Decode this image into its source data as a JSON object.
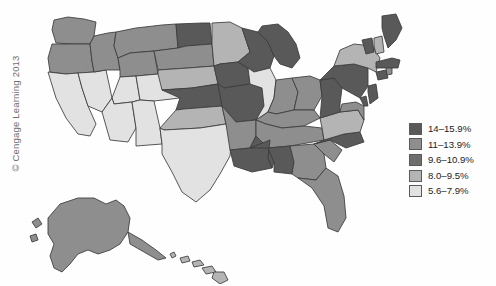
{
  "figure": {
    "credit": "© Cengage Learning 2013",
    "background_color": "#ffffff",
    "border_color": "#3b3b3b",
    "water_color": "#ffffff"
  },
  "legend": {
    "name": "choropleth-legend",
    "position": "right",
    "items": [
      {
        "label": "14–15.9%",
        "color": "#595959",
        "min": 14.0,
        "max": 15.9
      },
      {
        "label": "11–13.9%",
        "color": "#8e8e8e",
        "min": 11.0,
        "max": 13.9
      },
      {
        "label": "9.6–10.9%",
        "color": "#6e6e6e",
        "min": 9.6,
        "max": 10.9
      },
      {
        "label": "8.0–9.5%",
        "color": "#b4b4b4",
        "min": 8.0,
        "max": 9.5
      },
      {
        "label": "5.6–7.9%",
        "color": "#e2e2e2",
        "min": 5.6,
        "max": 7.9
      }
    ]
  },
  "chart_data": {
    "type": "choropleth",
    "title": "",
    "xlabel": "",
    "ylabel": "",
    "unit": "%",
    "value_bins": [
      "5.6–7.9%",
      "8.0–9.5%",
      "9.6–10.9%",
      "11–13.9%",
      "14–15.9%"
    ],
    "bin_colors": [
      "#e2e2e2",
      "#b4b4b4",
      "#6e6e6e",
      "#8e8e8e",
      "#595959"
    ],
    "regions": [
      {
        "code": "WA",
        "name": "Washington",
        "bin": "11–13.9%",
        "color": "#8e8e8e"
      },
      {
        "code": "OR",
        "name": "Oregon",
        "bin": "11–13.9%",
        "color": "#8e8e8e"
      },
      {
        "code": "ID",
        "name": "Idaho",
        "bin": "11–13.9%",
        "color": "#8e8e8e"
      },
      {
        "code": "MT",
        "name": "Montana",
        "bin": "11–13.9%",
        "color": "#8e8e8e"
      },
      {
        "code": "WY",
        "name": "Wyoming",
        "bin": "11–13.9%",
        "color": "#8e8e8e"
      },
      {
        "code": "ND",
        "name": "North Dakota",
        "bin": "14–15.9%",
        "color": "#595959"
      },
      {
        "code": "SD",
        "name": "South Dakota",
        "bin": "11–13.9%",
        "color": "#8e8e8e"
      },
      {
        "code": "NE",
        "name": "Nebraska",
        "bin": "8.0–9.5%",
        "color": "#b4b4b4"
      },
      {
        "code": "MN",
        "name": "Minnesota",
        "bin": "8.0–9.5%",
        "color": "#b4b4b4"
      },
      {
        "code": "IA",
        "name": "Iowa",
        "bin": "14–15.9%",
        "color": "#595959"
      },
      {
        "code": "WI",
        "name": "Wisconsin",
        "bin": "14–15.9%",
        "color": "#595959"
      },
      {
        "code": "MI",
        "name": "Michigan",
        "bin": "14–15.9%",
        "color": "#595959"
      },
      {
        "code": "IL",
        "name": "Illinois",
        "bin": "5.6–7.9%",
        "color": "#e2e2e2"
      },
      {
        "code": "IN",
        "name": "Indiana",
        "bin": "11–13.9%",
        "color": "#8e8e8e"
      },
      {
        "code": "OH",
        "name": "Ohio",
        "bin": "11–13.9%",
        "color": "#8e8e8e"
      },
      {
        "code": "MO",
        "name": "Missouri",
        "bin": "14–15.9%",
        "color": "#595959"
      },
      {
        "code": "KS",
        "name": "Kansas",
        "bin": "14–15.9%",
        "color": "#595959"
      },
      {
        "code": "OK",
        "name": "Oklahoma",
        "bin": "8.0–9.5%",
        "color": "#b4b4b4"
      },
      {
        "code": "TX",
        "name": "Texas",
        "bin": "5.6–7.9%",
        "color": "#e2e2e2"
      },
      {
        "code": "NM",
        "name": "New Mexico",
        "bin": "5.6–7.9%",
        "color": "#e2e2e2"
      },
      {
        "code": "AZ",
        "name": "Arizona",
        "bin": "5.6–7.9%",
        "color": "#e2e2e2"
      },
      {
        "code": "NV",
        "name": "Nevada",
        "bin": "5.6–7.9%",
        "color": "#e2e2e2"
      },
      {
        "code": "UT",
        "name": "Utah",
        "bin": "5.6–7.9%",
        "color": "#e2e2e2"
      },
      {
        "code": "CO",
        "name": "Colorado",
        "bin": "5.6–7.9%",
        "color": "#e2e2e2"
      },
      {
        "code": "CA",
        "name": "California",
        "bin": "5.6–7.9%",
        "color": "#e2e2e2"
      },
      {
        "code": "AR",
        "name": "Arkansas",
        "bin": "11–13.9%",
        "color": "#8e8e8e"
      },
      {
        "code": "LA",
        "name": "Louisiana",
        "bin": "14–15.9%",
        "color": "#595959"
      },
      {
        "code": "MS",
        "name": "Mississippi",
        "bin": "14–15.9%",
        "color": "#595959"
      },
      {
        "code": "AL",
        "name": "Alabama",
        "bin": "14–15.9%",
        "color": "#595959"
      },
      {
        "code": "TN",
        "name": "Tennessee",
        "bin": "11–13.9%",
        "color": "#8e8e8e"
      },
      {
        "code": "KY",
        "name": "Kentucky",
        "bin": "11–13.9%",
        "color": "#8e8e8e"
      },
      {
        "code": "WV",
        "name": "West Virginia",
        "bin": "14–15.9%",
        "color": "#595959"
      },
      {
        "code": "VA",
        "name": "Virginia",
        "bin": "8.0–9.5%",
        "color": "#b4b4b4"
      },
      {
        "code": "NC",
        "name": "North Carolina",
        "bin": "14–15.9%",
        "color": "#595959"
      },
      {
        "code": "SC",
        "name": "South Carolina",
        "bin": "11–13.9%",
        "color": "#8e8e8e"
      },
      {
        "code": "GA",
        "name": "Georgia",
        "bin": "11–13.9%",
        "color": "#8e8e8e"
      },
      {
        "code": "FL",
        "name": "Florida",
        "bin": "11–13.9%",
        "color": "#8e8e8e"
      },
      {
        "code": "MD",
        "name": "Maryland",
        "bin": "11–13.9%",
        "color": "#8e8e8e"
      },
      {
        "code": "DE",
        "name": "Delaware",
        "bin": "14–15.9%",
        "color": "#595959"
      },
      {
        "code": "PA",
        "name": "Pennsylvania",
        "bin": "14–15.9%",
        "color": "#595959"
      },
      {
        "code": "NJ",
        "name": "New Jersey",
        "bin": "14–15.9%",
        "color": "#595959"
      },
      {
        "code": "NY",
        "name": "New York",
        "bin": "8.0–9.5%",
        "color": "#b4b4b4"
      },
      {
        "code": "CT",
        "name": "Connecticut",
        "bin": "14–15.9%",
        "color": "#595959"
      },
      {
        "code": "RI",
        "name": "Rhode Island",
        "bin": "11–13.9%",
        "color": "#8e8e8e"
      },
      {
        "code": "MA",
        "name": "Massachusetts",
        "bin": "14–15.9%",
        "color": "#595959"
      },
      {
        "code": "VT",
        "name": "Vermont",
        "bin": "14–15.9%",
        "color": "#595959"
      },
      {
        "code": "NH",
        "name": "New Hampshire",
        "bin": "8.0–9.5%",
        "color": "#b4b4b4"
      },
      {
        "code": "ME",
        "name": "Maine",
        "bin": "14–15.9%",
        "color": "#595959"
      },
      {
        "code": "AK",
        "name": "Alaska",
        "bin": "11–13.9%",
        "color": "#8e8e8e"
      },
      {
        "code": "HI",
        "name": "Hawaii",
        "bin": "5.6–7.9%",
        "color": "#b4b4b4"
      }
    ]
  }
}
